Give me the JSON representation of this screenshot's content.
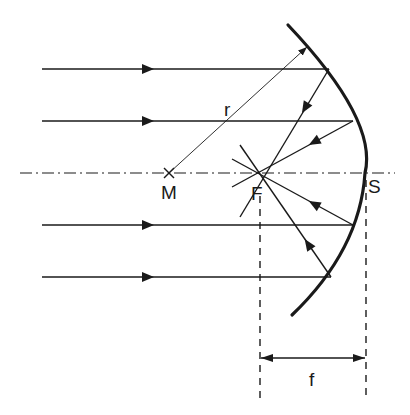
{
  "diagram": {
    "colors": {
      "background": "#ffffff",
      "stroke": "#1a1a1a"
    },
    "labels": {
      "center": "M",
      "focus": "F",
      "vertex": "S",
      "radius": "r",
      "focal_length": "f"
    },
    "optical_axis": {
      "y": 173,
      "x_start": 20,
      "x_end": 395,
      "style": "dash-dot"
    },
    "points": {
      "M": {
        "x": 169,
        "y": 173,
        "marker": "x"
      },
      "F": {
        "x": 258,
        "y": 173
      },
      "S": {
        "x": 365,
        "y": 173
      }
    },
    "mirror": {
      "type": "concave",
      "top": {
        "x": 288,
        "y": 25
      },
      "vertex": {
        "x": 365,
        "y": 173
      },
      "bottom": {
        "x": 292,
        "y": 315
      }
    },
    "incident_rays": [
      {
        "y": 69,
        "x_start": 42,
        "hit_x": 329
      },
      {
        "y": 121,
        "x_start": 42,
        "hit_x": 353
      },
      {
        "y": 225,
        "x_start": 42,
        "hit_x": 353
      },
      {
        "y": 277,
        "x_start": 42,
        "hit_x": 331
      }
    ],
    "radius_line": {
      "from": {
        "x": 169,
        "y": 173
      },
      "to": {
        "x": 307,
        "y": 47
      }
    },
    "focal_dimension": {
      "x1": 260,
      "x2": 366,
      "y": 358
    }
  }
}
